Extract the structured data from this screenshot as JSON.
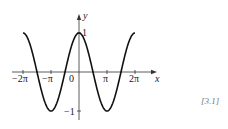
{
  "chart_data": {
    "type": "line",
    "title": "",
    "function": "y = cos(x)",
    "xlabel": "x",
    "ylabel": "y",
    "xlim": [
      -6.2832,
      6.2832
    ],
    "ylim": [
      -1,
      1
    ],
    "x_ticks": [
      {
        "value": -6.2832,
        "label": "−2π"
      },
      {
        "value": -3.1416,
        "label": "−π"
      },
      {
        "value": 0,
        "label": "0"
      },
      {
        "value": 3.1416,
        "label": "π"
      },
      {
        "value": 6.2832,
        "label": "2π"
      }
    ],
    "y_ticks": [
      {
        "value": 1,
        "label": "1"
      },
      {
        "value": -1,
        "label": "−1"
      }
    ],
    "grid": false,
    "legend": null,
    "series": [
      {
        "name": "cos x",
        "x": [
          -6.2832,
          -4.7124,
          -3.1416,
          -1.5708,
          0,
          1.5708,
          3.1416,
          4.7124,
          6.2832
        ],
        "values": [
          1,
          0,
          -1,
          0,
          1,
          0,
          -1,
          0,
          1
        ]
      }
    ]
  },
  "labels": {
    "x_axis": "x",
    "y_axis": "y",
    "tick_neg2pi": "−2π",
    "tick_negpi": "−π",
    "tick_zero": "0",
    "tick_pi": "π",
    "tick_2pi": "2π",
    "tick_y1": "1",
    "tick_yneg1": "−1",
    "figure_ref": "[3.1]"
  }
}
